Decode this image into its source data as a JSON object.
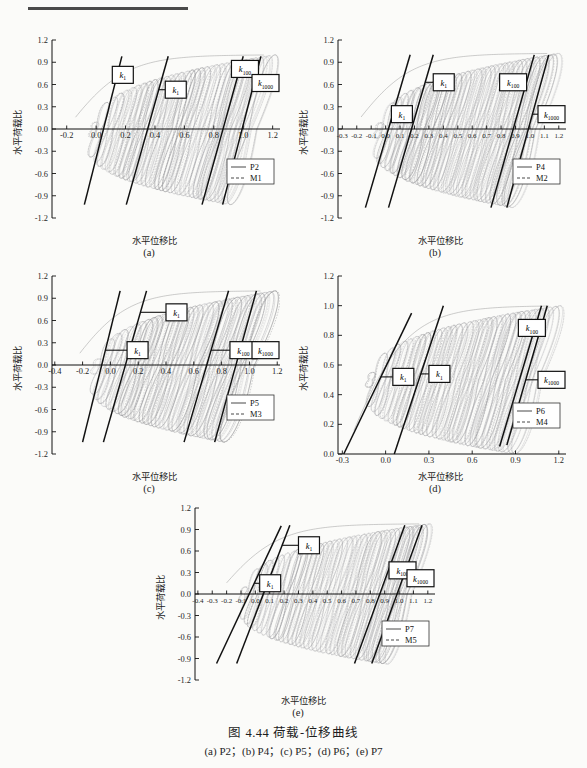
{
  "figure": {
    "caption_main": "图 4.44  荷载-位移曲线",
    "caption_sub": "(a) P2；(b) P4；(c) P5；(d) P6；(e) P7",
    "axis_label_x": "水平位移比",
    "axis_label_y": "水平荷载比",
    "k_labels": {
      "k1": "k",
      "k1_sub": "1",
      "k100": "k",
      "k100_sub": "100",
      "k1000": "k",
      "k1000_sub": "1000"
    }
  },
  "chart_data": [
    {
      "type": "line",
      "panel": "a",
      "subcaption": "(a)",
      "title": "",
      "xlabel": "水平位移比",
      "ylabel": "水平荷载比",
      "xlim": [
        -0.3,
        1.25
      ],
      "ylim": [
        -1.2,
        1.2
      ],
      "xticks": [
        -0.2,
        0.0,
        0.2,
        0.4,
        0.6,
        0.8,
        1.0,
        1.2
      ],
      "xticklabels": [
        "-0.2",
        "0.0",
        "0.2",
        "0.4",
        "0.6",
        "0.8",
        "1.0",
        "1.2"
      ],
      "yticks": [
        -1.2,
        -0.9,
        -0.6,
        -0.3,
        0.0,
        0.3,
        0.6,
        0.9,
        1.2
      ],
      "yticklabels": [
        "-1.2",
        "-0.9",
        "-0.6",
        "-0.3",
        "0.0",
        "0.3",
        "0.6",
        "0.9",
        "1.2"
      ],
      "grid": false,
      "legend_position": "lower-right",
      "series": [
        {
          "name": "P2",
          "style": "solid"
        },
        {
          "name": "M1",
          "style": "dashed"
        }
      ],
      "hysteresis": {
        "cycle_count": 34,
        "drift_start": -0.02,
        "drift_end": 1.06,
        "load_peak_pos": 1.0,
        "load_peak_neg": -1.02,
        "loop_half_width": 0.165,
        "envelope_top": 1.0,
        "envelope_bottom": -1.02
      },
      "stiffness_lines": [
        {
          "label": "k1",
          "x0": -0.08,
          "y0": -1.02,
          "x1": 0.175,
          "y1": 0.98,
          "box_x": 0.11,
          "box_y": 0.73
        },
        {
          "label": "k1",
          "x0": 0.205,
          "y0": -1.02,
          "x1": 0.49,
          "y1": 0.98,
          "box_x": 0.47,
          "box_y": 0.53
        },
        {
          "label": "k100",
          "x0": 0.72,
          "y0": -1.02,
          "x1": 1.0,
          "y1": 0.98,
          "box_x": 0.92,
          "box_y": 0.81
        },
        {
          "label": "k1000",
          "x0": 0.86,
          "y0": -1.02,
          "x1": 1.12,
          "y1": 0.98,
          "box_x": 1.14,
          "box_y": 0.62
        }
      ]
    },
    {
      "type": "line",
      "panel": "b",
      "subcaption": "(b)",
      "title": "",
      "xlabel": "水平位移比",
      "ylabel": "水平荷载比",
      "xlim": [
        -0.33,
        1.25
      ],
      "ylim": [
        -1.2,
        1.2
      ],
      "xticks": [
        -0.3,
        -0.2,
        -0.1,
        0.0,
        0.1,
        0.2,
        0.3,
        0.4,
        0.5,
        0.6,
        0.7,
        0.8,
        0.9,
        1.0,
        1.1,
        1.2
      ],
      "xticklabels": [
        "-0.3",
        "-0.2",
        "-0.1",
        "0.0",
        "0.1",
        "0.2",
        "0.3",
        "0.4",
        "0.5",
        "0.6",
        "0.7",
        "0.8",
        "0.9",
        "1.0",
        "1.1",
        "1.2"
      ],
      "yticks": [
        -1.2,
        -0.9,
        -0.6,
        -0.3,
        0.0,
        0.3,
        0.6,
        0.9,
        1.2
      ],
      "yticklabels": [
        "-1.2",
        "-0.9",
        "-0.6",
        "-0.3",
        "0.0",
        "0.3",
        "0.6",
        "0.9",
        "1.2"
      ],
      "grid": false,
      "legend_position": "lower-right",
      "series": [
        {
          "name": "P4",
          "style": "solid"
        },
        {
          "name": "M2",
          "style": "dashed"
        }
      ],
      "hysteresis": {
        "cycle_count": 36,
        "drift_start": -0.05,
        "drift_end": 1.04,
        "load_peak_pos": 1.02,
        "load_peak_neg": -1.06,
        "loop_half_width": 0.175,
        "envelope_top": 1.02,
        "envelope_bottom": -1.06
      },
      "stiffness_lines": [
        {
          "label": "k1",
          "x0": -0.14,
          "y0": -1.06,
          "x1": 0.17,
          "y1": 1.0,
          "box_x": 0.04,
          "box_y": 0.2
        },
        {
          "label": "k1",
          "x0": 0.02,
          "y0": -1.06,
          "x1": 0.33,
          "y1": 1.0,
          "box_x": 0.33,
          "box_y": 0.63
        },
        {
          "label": "k100",
          "x0": 0.73,
          "y0": -1.06,
          "x1": 1.03,
          "y1": 1.0,
          "box_x": 0.79,
          "box_y": 0.63
        },
        {
          "label": "k1000",
          "x0": 0.84,
          "y0": -1.06,
          "x1": 1.13,
          "y1": 1.0,
          "box_x": 1.06,
          "box_y": 0.2
        }
      ]
    },
    {
      "type": "line",
      "panel": "c",
      "subcaption": "(c)",
      "title": "",
      "xlabel": "水平位移比",
      "ylabel": "水平荷载比",
      "xlim": [
        -0.42,
        1.22
      ],
      "ylim": [
        -1.2,
        1.2
      ],
      "xticks": [
        -0.4,
        -0.2,
        0.0,
        0.2,
        0.4,
        0.6,
        0.8,
        1.0,
        1.2
      ],
      "xticklabels": [
        "-0.4",
        "-0.2",
        "0.0",
        "0.2",
        "0.4",
        "0.6",
        "0.8",
        "1.0",
        "1.2"
      ],
      "yticks": [
        -1.2,
        -0.9,
        -0.6,
        -0.3,
        0.0,
        0.3,
        0.6,
        0.9,
        1.2
      ],
      "yticklabels": [
        "-1.2",
        "-0.9",
        "-0.6",
        "-0.3",
        "0.0",
        "0.3",
        "0.6",
        "0.9",
        "1.2"
      ],
      "grid": false,
      "legend_position": "lower-right",
      "series": [
        {
          "name": "P5",
          "style": "solid"
        },
        {
          "name": "M3",
          "style": "dashed"
        }
      ],
      "hysteresis": {
        "cycle_count": 34,
        "drift_start": -0.1,
        "drift_end": 1.0,
        "load_peak_pos": 1.0,
        "load_peak_neg": -1.04,
        "loop_half_width": 0.2,
        "envelope_top": 1.0,
        "envelope_bottom": -1.04
      },
      "stiffness_lines": [
        {
          "label": "k1",
          "x0": -0.2,
          "y0": -1.04,
          "x1": 0.07,
          "y1": 1.0,
          "box_x": 0.12,
          "box_y": 0.2
        },
        {
          "label": "k1",
          "x0": -0.05,
          "y0": -1.04,
          "x1": 0.26,
          "y1": 1.0,
          "box_x": 0.4,
          "box_y": 0.71
        },
        {
          "label": "k100",
          "x0": 0.53,
          "y0": -1.04,
          "x1": 0.85,
          "y1": 1.0,
          "box_x": 0.86,
          "box_y": 0.2
        },
        {
          "label": "k1000",
          "x0": 0.75,
          "y0": -1.04,
          "x1": 1.05,
          "y1": 1.0,
          "box_x": 1.06,
          "box_y": 0.2
        }
      ]
    },
    {
      "type": "line",
      "panel": "d",
      "subcaption": "(d)",
      "title": "",
      "xlabel": "水平位移比",
      "ylabel": "水平荷载比",
      "xlim": [
        -0.33,
        1.25
      ],
      "ylim": [
        0.0,
        1.2
      ],
      "xticks": [
        -0.3,
        0.0,
        0.3,
        0.6,
        0.9,
        1.2
      ],
      "xticklabels": [
        "-0.3",
        "0.0",
        "0.3",
        "0.6",
        "0.9",
        "1.2"
      ],
      "yticks": [
        0.0,
        0.2,
        0.4,
        0.6,
        0.8,
        1.0,
        1.2
      ],
      "yticklabels": [
        "0.0",
        "0.2",
        "0.4",
        "0.6",
        "0.8",
        "1.0",
        "1.2"
      ],
      "grid": false,
      "legend_position": "lower-right",
      "series": [
        {
          "name": "P6",
          "style": "solid"
        },
        {
          "name": "M4",
          "style": "dashed"
        }
      ],
      "hysteresis": {
        "cycle_count": 36,
        "drift_start": -0.1,
        "drift_end": 1.05,
        "load_peak_pos": 1.0,
        "load_peak_neg": 0.0,
        "loop_half_width": 0.17,
        "envelope_top": 1.0,
        "envelope_bottom": 0.0
      },
      "stiffness_lines": [
        {
          "label": "k1",
          "x0": -0.29,
          "y0": 0.0,
          "x1": 0.18,
          "y1": 0.95,
          "box_x": 0.05,
          "box_y": 0.52
        },
        {
          "label": "k1",
          "x0": 0.06,
          "y0": 0.0,
          "x1": 0.4,
          "y1": 1.0,
          "box_x": 0.3,
          "box_y": 0.54
        },
        {
          "label": "k100",
          "x0": 0.79,
          "y0": 0.05,
          "x1": 1.08,
          "y1": 1.0,
          "box_x": 0.92,
          "box_y": 0.85
        },
        {
          "label": "k1000",
          "x0": 0.84,
          "y0": 0.06,
          "x1": 1.12,
          "y1": 1.0,
          "box_x": 1.06,
          "box_y": 0.5
        }
      ]
    },
    {
      "type": "line",
      "panel": "e",
      "subcaption": "(e)",
      "title": "",
      "xlabel": "水平位移比",
      "ylabel": "水平荷载比",
      "xlim": [
        -0.42,
        1.25
      ],
      "ylim": [
        -1.2,
        1.2
      ],
      "xticks": [
        -0.4,
        -0.3,
        -0.2,
        -0.1,
        0.0,
        0.1,
        0.2,
        0.3,
        0.4,
        0.5,
        0.6,
        0.7,
        0.8,
        0.9,
        1.0,
        1.1,
        1.2
      ],
      "xticklabels": [
        "-0.4",
        "-0.3",
        "-0.2",
        "-0.1",
        "0.0",
        "0.1",
        "0.2",
        "0.3",
        "0.4",
        "0.5",
        "0.6",
        "0.7",
        "0.8",
        "0.9",
        "1.0",
        "1.1",
        "1.2"
      ],
      "yticks": [
        -1.2,
        -0.9,
        -0.6,
        -0.3,
        0.0,
        0.3,
        0.6,
        0.9,
        1.2
      ],
      "yticklabels": [
        "-1.2",
        "-0.9",
        "-0.6",
        "-0.3",
        "0.0",
        "0.3",
        "0.6",
        "0.9",
        "1.2"
      ],
      "grid": false,
      "legend_position": "lower-right",
      "series": [
        {
          "name": "P7",
          "style": "solid"
        },
        {
          "name": "M5",
          "style": "dashed"
        }
      ],
      "hysteresis": {
        "cycle_count": 36,
        "drift_start": -0.08,
        "drift_end": 1.06,
        "load_peak_pos": 0.98,
        "load_peak_neg": -0.98,
        "loop_half_width": 0.16,
        "envelope_top": 0.98,
        "envelope_bottom": -0.98
      },
      "stiffness_lines": [
        {
          "label": "k1",
          "x0": -0.27,
          "y0": -0.97,
          "x1": 0.18,
          "y1": 0.95,
          "box_x": 0.03,
          "box_y": 0.15
        },
        {
          "label": "k1",
          "x0": -0.13,
          "y0": -0.97,
          "x1": 0.24,
          "y1": 0.96,
          "box_x": 0.3,
          "box_y": 0.68
        },
        {
          "label": "k100",
          "x0": 0.69,
          "y0": -0.97,
          "x1": 1.04,
          "y1": 0.96,
          "box_x": 0.93,
          "box_y": 0.33
        },
        {
          "label": "k1000",
          "x0": 0.81,
          "y0": -0.97,
          "x1": 1.16,
          "y1": 0.96,
          "box_x": 1.15,
          "box_y": 0.22
        }
      ]
    }
  ]
}
